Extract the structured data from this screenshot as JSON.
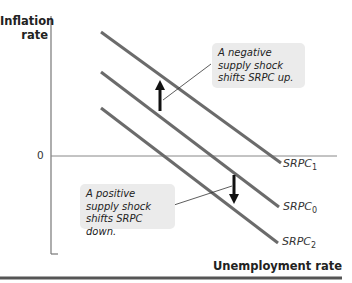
{
  "axes": {
    "y_label_line1": "Inflation",
    "y_label_line2": "rate",
    "x_label": "Unemployment rate",
    "origin_label": "0"
  },
  "curves": [
    {
      "name": "SRPC",
      "subscript": "1"
    },
    {
      "name": "SRPC",
      "subscript": "0"
    },
    {
      "name": "SRPC",
      "subscript": "2"
    }
  ],
  "callouts": {
    "negative": "A negative supply shock shifts SRPC up.",
    "positive": "A positive supply shock shifts SRPC down."
  },
  "colors": {
    "curve": "#6b6b6b",
    "axis": "#777777",
    "arrow": "#111111",
    "callout_bg": "#ebebeb",
    "rule": "#555555"
  }
}
